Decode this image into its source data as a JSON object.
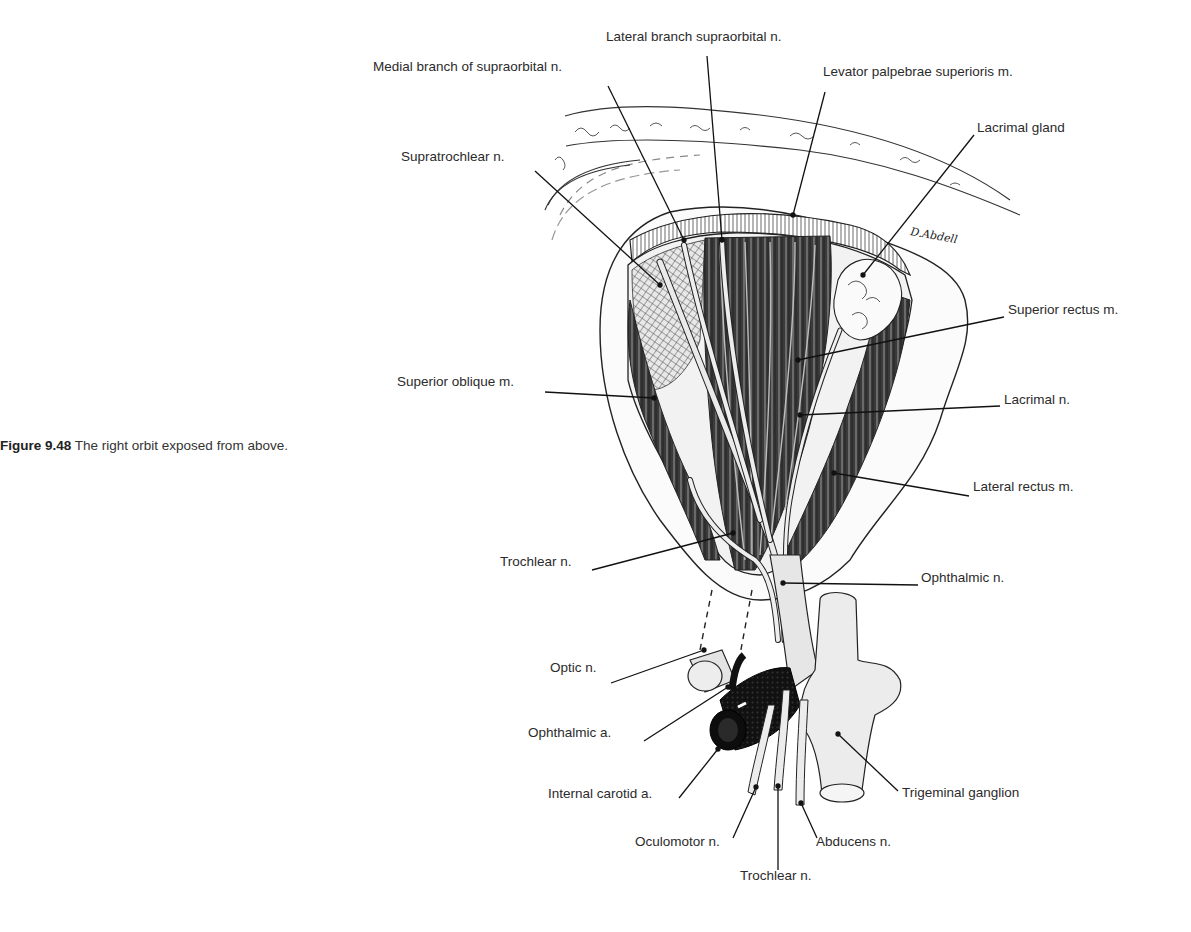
{
  "caption": {
    "figure_number": "Figure 9.48",
    "text": "The right orbit exposed from above."
  },
  "signature": "D.Abdell",
  "labels": [
    {
      "id": "lateral-branch-supraorbital",
      "text": "Lateral branch supraorbital n.",
      "x": 606,
      "y": 37,
      "lx1": 707,
      "ly1": 56,
      "lx2": 722,
      "ly2": 240
    },
    {
      "id": "medial-branch-supraorbital",
      "text": "Medial branch of supraorbital n.",
      "x": 373,
      "y": 67,
      "lx1": 608,
      "ly1": 86,
      "lx2": 684,
      "ly2": 240
    },
    {
      "id": "levator-palpebrae",
      "text": "Levator palpebrae superioris m.",
      "x": 823,
      "y": 72,
      "lx1": 825,
      "ly1": 92,
      "lx2": 793,
      "ly2": 215
    },
    {
      "id": "lacrimal-gland",
      "text": "Lacrimal gland",
      "x": 977,
      "y": 128,
      "lx1": 974,
      "ly1": 135,
      "lx2": 863,
      "ly2": 275
    },
    {
      "id": "supratrochlear",
      "text": "Supratrochlear n.",
      "x": 401,
      "y": 157,
      "lx1": 535,
      "ly1": 171,
      "lx2": 660,
      "ly2": 285
    },
    {
      "id": "superior-rectus",
      "text": "Superior rectus m.",
      "x": 1008,
      "y": 310,
      "lx1": 1004,
      "ly1": 317,
      "lx2": 798,
      "ly2": 360
    },
    {
      "id": "superior-oblique",
      "text": "Superior oblique m.",
      "x": 397,
      "y": 382,
      "lx1": 545,
      "ly1": 392,
      "lx2": 654,
      "ly2": 398
    },
    {
      "id": "lacrimal-n",
      "text": "Lacrimal n.",
      "x": 1004,
      "y": 400,
      "lx1": 1000,
      "ly1": 406,
      "lx2": 800,
      "ly2": 415
    },
    {
      "id": "lateral-rectus",
      "text": "Lateral rectus m.",
      "x": 973,
      "y": 487,
      "lx1": 969,
      "ly1": 496,
      "lx2": 834,
      "ly2": 473
    },
    {
      "id": "trochlear-n-upper",
      "text": "Trochlear n.",
      "x": 500,
      "y": 562,
      "lx1": 592,
      "ly1": 570,
      "lx2": 733,
      "ly2": 533
    },
    {
      "id": "ophthalmic-n",
      "text": "Ophthalmic n.",
      "x": 921,
      "y": 578,
      "lx1": 918,
      "ly1": 585,
      "lx2": 783,
      "ly2": 583
    },
    {
      "id": "optic-n",
      "text": "Optic n.",
      "x": 550,
      "y": 668,
      "lx1": 611,
      "ly1": 683,
      "lx2": 704,
      "ly2": 650
    },
    {
      "id": "ophthalmic-a",
      "text": "Ophthalmic a.",
      "x": 528,
      "y": 733,
      "lx1": 644,
      "ly1": 741,
      "lx2": 728,
      "ly2": 687
    },
    {
      "id": "internal-carotid-a",
      "text": "Internal carotid a.",
      "x": 548,
      "y": 794,
      "lx1": 679,
      "ly1": 798,
      "lx2": 718,
      "ly2": 749
    },
    {
      "id": "trigeminal-ganglion",
      "text": "Trigeminal ganglion",
      "x": 902,
      "y": 793,
      "lx1": 898,
      "ly1": 791,
      "lx2": 838,
      "ly2": 734
    },
    {
      "id": "oculomotor-n",
      "text": "Oculomotor n.",
      "x": 635,
      "y": 842,
      "lx1": 733,
      "ly1": 838,
      "lx2": 756,
      "ly2": 787
    },
    {
      "id": "abducens-n",
      "text": "Abducens n.",
      "x": 816,
      "y": 842,
      "lx1": 817,
      "ly1": 838,
      "lx2": 801,
      "ly2": 803
    },
    {
      "id": "trochlear-n-lower",
      "text": "Trochlear n.",
      "x": 740,
      "y": 876,
      "lx1": 778,
      "ly1": 870,
      "lx2": 778,
      "ly2": 786
    }
  ]
}
